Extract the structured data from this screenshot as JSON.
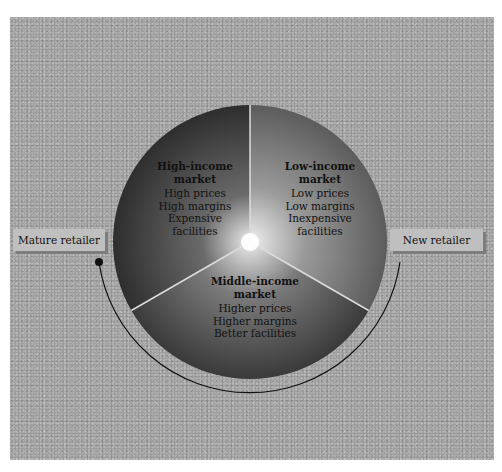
{
  "diagram": {
    "type": "market-segmentation-wheel",
    "segments": [
      {
        "id": "high-income",
        "title": "High-income market",
        "title_lines": [
          "High-income",
          "market"
        ],
        "attributes": [
          "High prices",
          "High margins",
          "Expensive",
          "facilities"
        ]
      },
      {
        "id": "low-income",
        "title": "Low-income market",
        "title_lines": [
          "Low-income",
          "market"
        ],
        "attributes": [
          "Low prices",
          "Low margins",
          "Inexpensive",
          "facilities"
        ]
      },
      {
        "id": "middle-income",
        "title": "Middle-income market",
        "title_lines": [
          "Middle-income",
          "market"
        ],
        "attributes": [
          "Higher prices",
          "Higher margins",
          "Better facilities"
        ]
      }
    ],
    "labels": {
      "mature_retailer": "Mature retailer",
      "new_retailer": "New retailer"
    },
    "colors": {
      "background": "#9a9a9a",
      "segment_left": "#3a3a3a",
      "segment_right": "#6e6e6e",
      "segment_bottom": "#4a4a4a",
      "divider": "#d8d8d8",
      "label_box": "#bfbfbf",
      "label_shadow": "#7d7d7d",
      "arc": "#111111"
    }
  }
}
